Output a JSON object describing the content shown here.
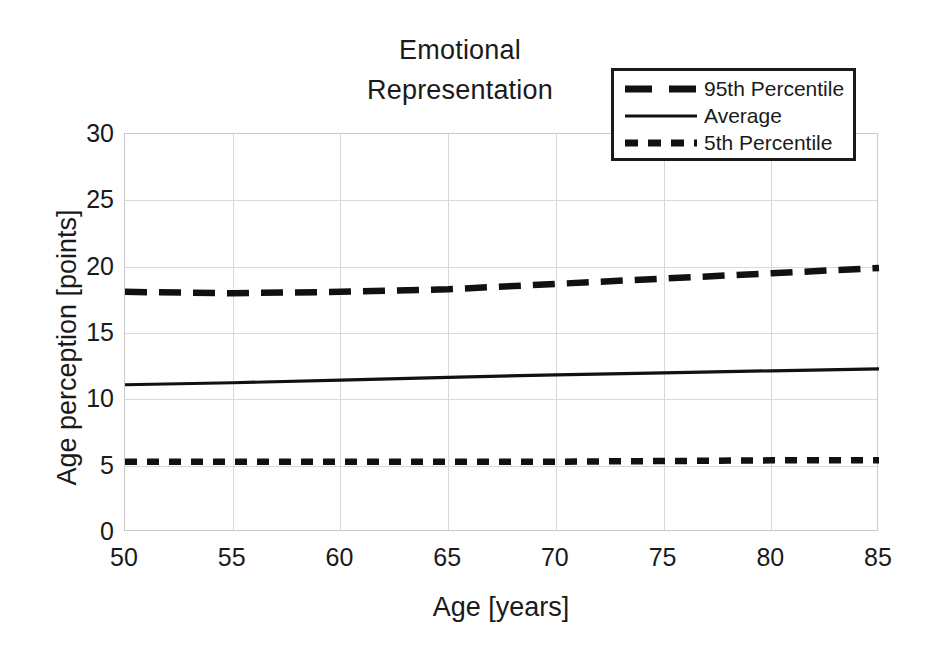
{
  "chart_data": {
    "type": "line",
    "title": "Emotional\nRepresentation",
    "xlabel": "Age [years]",
    "ylabel": "Age perception [points]",
    "xlim": [
      50,
      85
    ],
    "ylim": [
      0,
      30
    ],
    "xticks": [
      50,
      55,
      60,
      65,
      70,
      75,
      80,
      85
    ],
    "yticks": [
      0,
      5,
      10,
      15,
      20,
      25,
      30
    ],
    "grid": true,
    "legend_position": "top-right",
    "x": [
      50,
      55,
      60,
      65,
      70,
      75,
      80,
      85
    ],
    "series": [
      {
        "name": "95th Percentile",
        "style": "long-dash",
        "color": "#111111",
        "values": [
          18.1,
          18.0,
          18.1,
          18.3,
          18.7,
          19.1,
          19.5,
          19.9
        ]
      },
      {
        "name": "Average",
        "style": "solid",
        "color": "#111111",
        "values": [
          11.1,
          11.25,
          11.45,
          11.65,
          11.85,
          12.0,
          12.15,
          12.3
        ]
      },
      {
        "name": "5th Percentile",
        "style": "short-dash",
        "color": "#111111",
        "values": [
          5.3,
          5.3,
          5.3,
          5.3,
          5.3,
          5.35,
          5.4,
          5.4
        ]
      }
    ]
  },
  "axes": {
    "ytick_labels": [
      "30",
      "25",
      "20",
      "15",
      "10",
      "5",
      "0"
    ],
    "xtick_labels": [
      "50",
      "55",
      "60",
      "65",
      "70",
      "75",
      "80",
      "85"
    ],
    "x_title": "Age [years]",
    "y_title": "Age perception [points]"
  },
  "title": {
    "line1": "Emotional",
    "line2": "Representation",
    "full": "Emotional\nRepresentation"
  },
  "legend": {
    "items": [
      {
        "label": "95th Percentile",
        "style": "long-dash"
      },
      {
        "label": "Average",
        "style": "solid"
      },
      {
        "label": "5th Percentile",
        "style": "short-dash"
      }
    ]
  },
  "colors": {
    "series": "#111111",
    "grid": "#d9d9d9",
    "frame": "#c9c9c9",
    "background": "#ffffff",
    "text": "#1a1a1a"
  }
}
